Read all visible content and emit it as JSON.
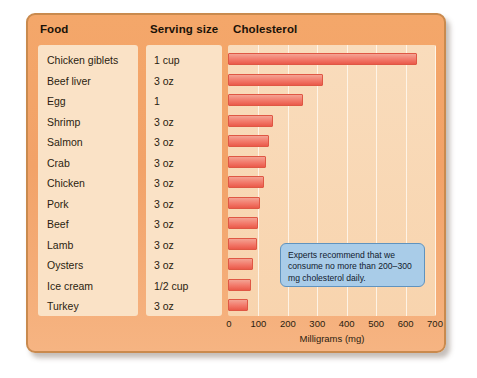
{
  "header": {
    "food": "Food",
    "serving": "Serving size",
    "cholesterol": "Cholesterol"
  },
  "callout": {
    "text": "Experts recommend that we consume no more than 200–300 mg cholesterol daily."
  },
  "axis": {
    "title": "Milligrams (mg)",
    "ticks": [
      "0",
      "100",
      "200",
      "300",
      "400",
      "500",
      "600",
      "700"
    ]
  },
  "rows": [
    {
      "food": "Chicken giblets",
      "serving": "1 cup",
      "value": 640
    },
    {
      "food": "Beef liver",
      "serving": "3 oz",
      "value": 320
    },
    {
      "food": "Egg",
      "serving": "1",
      "value": 250
    },
    {
      "food": "Shrimp",
      "serving": "3 oz",
      "value": 150
    },
    {
      "food": "Salmon",
      "serving": "3 oz",
      "value": 135
    },
    {
      "food": "Crab",
      "serving": "3 oz",
      "value": 125
    },
    {
      "food": "Chicken",
      "serving": "3 oz",
      "value": 118
    },
    {
      "food": "Pork",
      "serving": "3 oz",
      "value": 105
    },
    {
      "food": "Beef",
      "serving": "3 oz",
      "value": 100
    },
    {
      "food": "Lamb",
      "serving": "3 oz",
      "value": 95
    },
    {
      "food": "Oysters",
      "serving": "3 oz",
      "value": 80
    },
    {
      "food": "Ice cream",
      "serving": "1/2 cup",
      "value": 75
    },
    {
      "food": "Turkey",
      "serving": "3 oz",
      "value": 65
    }
  ],
  "chart_data": {
    "type": "bar",
    "orientation": "horizontal",
    "title": "Cholesterol",
    "xlabel": "Milligrams (mg)",
    "ylabel": "",
    "xlim": [
      0,
      700
    ],
    "xticks": [
      0,
      100,
      200,
      300,
      400,
      500,
      600,
      700
    ],
    "grid": true,
    "legend": null,
    "categories": [
      "Chicken giblets",
      "Beef liver",
      "Egg",
      "Shrimp",
      "Salmon",
      "Crab",
      "Chicken",
      "Pork",
      "Beef",
      "Lamb",
      "Oysters",
      "Ice cream",
      "Turkey"
    ],
    "values": [
      640,
      320,
      250,
      150,
      135,
      125,
      118,
      105,
      100,
      95,
      80,
      75,
      65
    ],
    "serving_sizes": [
      "1 cup",
      "3 oz",
      "1",
      "3 oz",
      "3 oz",
      "3 oz",
      "3 oz",
      "3 oz",
      "3 oz",
      "3 oz",
      "3 oz",
      "1/2 cup",
      "3 oz"
    ],
    "annotations": [
      "Experts recommend that we consume no more than 200–300 mg cholesterol daily."
    ],
    "colors": {
      "bar": "#ea5a4a",
      "panel": "#f2a268",
      "plot_bg": "#f8d4ae",
      "callout": "#a9cce8"
    }
  }
}
